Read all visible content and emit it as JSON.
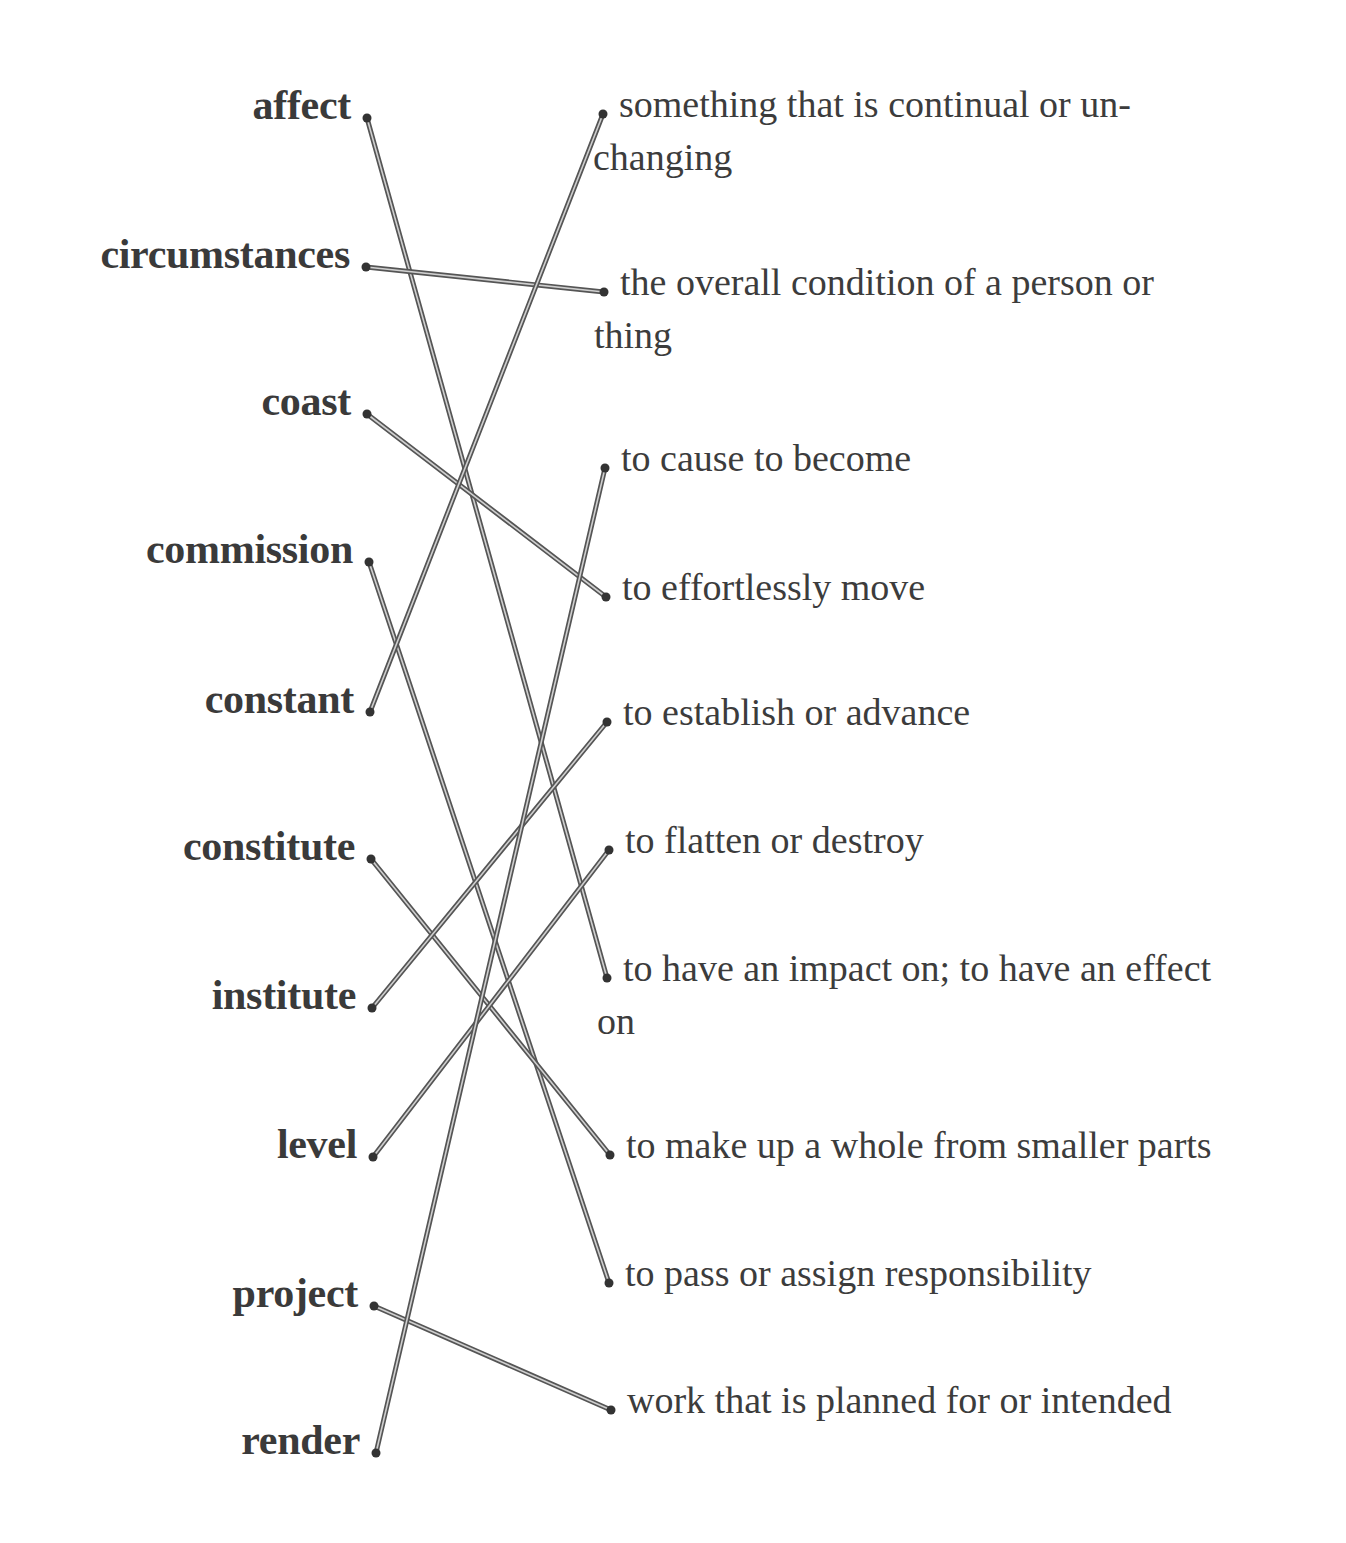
{
  "diagram": {
    "type": "matching-exercise",
    "line_color": "#555555",
    "dot_color": "#333333",
    "text_color": "#3a3a3a",
    "terms": [
      {
        "label": "affect",
        "x": 367,
        "y": 118
      },
      {
        "label": "circumstances",
        "x": 366,
        "y": 267
      },
      {
        "label": "coast",
        "x": 367,
        "y": 414
      },
      {
        "label": "commission",
        "x": 369,
        "y": 562
      },
      {
        "label": "constant",
        "x": 370,
        "y": 712
      },
      {
        "label": "constitute",
        "x": 371,
        "y": 859
      },
      {
        "label": "institute",
        "x": 372,
        "y": 1008
      },
      {
        "label": "level",
        "x": 373,
        "y": 1157
      },
      {
        "label": "project",
        "x": 374,
        "y": 1306
      },
      {
        "label": "render",
        "x": 376,
        "y": 1453
      }
    ],
    "definitions": [
      {
        "line1": "something that is continual or un-",
        "line2": "changing",
        "x": 603,
        "y": 114
      },
      {
        "line1": "the overall condition of a person or",
        "line2": "thing",
        "x": 604,
        "y": 292
      },
      {
        "line1": "to cause to become",
        "line2": "",
        "x": 605,
        "y": 468
      },
      {
        "line1": "to effortlessly move",
        "line2": "",
        "x": 606,
        "y": 597
      },
      {
        "line1": "to establish or advance",
        "line2": "",
        "x": 607,
        "y": 722
      },
      {
        "line1": "to flatten or destroy",
        "line2": "",
        "x": 609,
        "y": 850
      },
      {
        "line1": "to have an impact on; to have an effect",
        "line2": "on",
        "x": 607,
        "y": 978
      },
      {
        "line1": "to make up a whole from smaller parts",
        "line2": "",
        "x": 610,
        "y": 1155
      },
      {
        "line1": "to pass or assign responsibility",
        "line2": "",
        "x": 609,
        "y": 1283
      },
      {
        "line1": "work that is planned for or intended",
        "line2": "",
        "x": 611,
        "y": 1410
      }
    ],
    "connections": [
      {
        "term": "affect",
        "definition": "to have an impact on; to have an effect on",
        "from": 0,
        "to": 6
      },
      {
        "term": "circumstances",
        "definition": "the overall condition of a person or thing",
        "from": 1,
        "to": 1
      },
      {
        "term": "coast",
        "definition": "to effortlessly move",
        "from": 2,
        "to": 3
      },
      {
        "term": "commission",
        "definition": "to pass or assign responsibility",
        "from": 3,
        "to": 8
      },
      {
        "term": "constant",
        "definition": "something that is continual or unchanging",
        "from": 4,
        "to": 0
      },
      {
        "term": "constitute",
        "definition": "to make up a whole from smaller parts",
        "from": 5,
        "to": 7
      },
      {
        "term": "institute",
        "definition": "to establish or advance",
        "from": 6,
        "to": 4
      },
      {
        "term": "level",
        "definition": "to flatten or destroy",
        "from": 7,
        "to": 5
      },
      {
        "term": "project",
        "definition": "work that is planned for or intended",
        "from": 8,
        "to": 9
      },
      {
        "term": "render",
        "definition": "to cause to become",
        "from": 9,
        "to": 2
      }
    ]
  }
}
